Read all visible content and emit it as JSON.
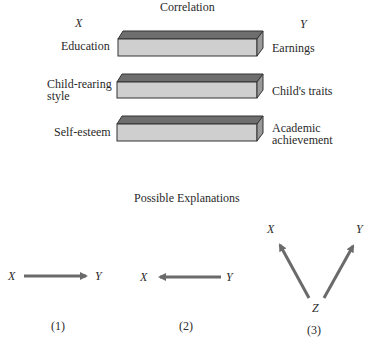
{
  "correlation": {
    "title": "Correlation",
    "x_header": "X",
    "y_header": "Y",
    "rows": [
      {
        "x_label_line1": "Education",
        "x_label_line2": "",
        "y_label_line1": "Earnings",
        "y_label_line2": ""
      },
      {
        "x_label_line1": "Child-rearing",
        "x_label_line2": "style",
        "y_label_line1": "Child's traits",
        "y_label_line2": ""
      },
      {
        "x_label_line1": "Self-esteem",
        "x_label_line2": "",
        "y_label_line1": "Academic",
        "y_label_line2": "achievement"
      }
    ],
    "bar_colors": {
      "top": "#6e6e6e",
      "front": "#cfcfcf",
      "side": "#9a9a9a",
      "edge": "#333333"
    }
  },
  "explanations": {
    "title": "Possible Explanations",
    "items": [
      {
        "number": "(1)",
        "from": "X",
        "to": "Y",
        "direction": "X causes Y"
      },
      {
        "number": "(2)",
        "from": "Y",
        "to": "X",
        "direction": "Y causes X"
      },
      {
        "number": "(3)",
        "source": "Z",
        "targets": [
          "X",
          "Y"
        ],
        "direction": "Z causes both X and Y"
      }
    ],
    "arrow_color": "#6a6a6a"
  }
}
